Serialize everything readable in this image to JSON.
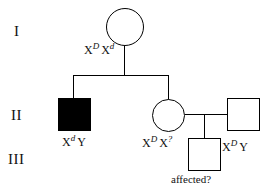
{
  "diagram": {
    "type": "pedigree-chart",
    "background_color": "#ffffff",
    "stroke_color": "#000000",
    "affected_fill_color": "#000000",
    "unaffected_fill_color": "#ffffff"
  },
  "generations": [
    {
      "id": "I",
      "label": "I"
    },
    {
      "id": "II",
      "label": "II"
    },
    {
      "id": "III",
      "label": "III"
    }
  ],
  "individuals": [
    {
      "id": "i-female",
      "generation": "I",
      "sex": "female",
      "shape": "circle",
      "affected": false,
      "genotype": {
        "allele1_base": "X",
        "allele1_sup": "D",
        "allele2_base": "X",
        "allele2_sup": "d"
      }
    },
    {
      "id": "ii-male-affected",
      "generation": "II",
      "sex": "male",
      "shape": "square",
      "affected": true,
      "genotype": {
        "allele1_base": "X",
        "allele1_sup": "d",
        "allele2_base": "Y",
        "allele2_sup": ""
      }
    },
    {
      "id": "ii-female",
      "generation": "II",
      "sex": "female",
      "shape": "circle",
      "affected": false,
      "genotype": {
        "allele1_base": "X",
        "allele1_sup": "D",
        "allele2_base": "X",
        "allele2_sup": "?"
      }
    },
    {
      "id": "ii-male-spouse",
      "generation": "II",
      "sex": "male",
      "shape": "square",
      "affected": false,
      "genotype": {
        "allele1_base": "X",
        "allele1_sup": "D",
        "allele2_base": "Y",
        "allele2_sup": ""
      }
    },
    {
      "id": "iii-male",
      "generation": "III",
      "sex": "male",
      "shape": "square",
      "affected": null,
      "status_label": "affected?"
    }
  ]
}
